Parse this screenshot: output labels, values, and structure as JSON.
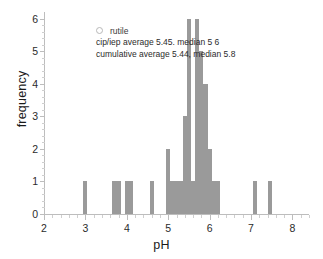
{
  "chart_data": {
    "type": "bar",
    "title": "",
    "xlabel": "pH",
    "ylabel": "frequency",
    "xlim": [
      2,
      8.4
    ],
    "ylim": [
      0,
      6.2
    ],
    "grid": false,
    "bar_color": "#9a9a9a",
    "legend": {
      "position": "upper-left-inside",
      "entries": [
        {
          "marker": "open-circle",
          "label": "rutile"
        }
      ]
    },
    "annotations": [
      "cip/iep average 5.45. median 5 6",
      "cumulative average 5.44, median 5.8"
    ],
    "xticks": [
      2,
      3,
      4,
      5,
      6,
      7,
      8
    ],
    "xtick_labels": [
      "2",
      "3",
      "4",
      "5",
      "6",
      "7",
      "8"
    ],
    "yticks": [
      0,
      1,
      2,
      3,
      4,
      5,
      6
    ],
    "ytick_labels": [
      "0",
      "1",
      "2",
      "3",
      "4",
      "5",
      "6"
    ],
    "bin_width": 0.1,
    "x": [
      3.0,
      3.7,
      3.8,
      4.0,
      4.1,
      4.6,
      5.0,
      5.1,
      5.2,
      5.3,
      5.4,
      5.5,
      5.6,
      5.7,
      5.8,
      5.9,
      6.0,
      6.1,
      6.2,
      7.1,
      7.45
    ],
    "values": [
      1,
      1,
      1,
      1,
      1,
      1,
      2,
      1,
      1,
      1,
      3,
      6,
      1,
      6,
      5,
      4,
      2,
      1,
      1,
      1,
      1
    ],
    "categories": [
      "3.0",
      "3.7",
      "3.8",
      "4.0",
      "4.1",
      "4.6",
      "5.0",
      "5.1",
      "5.2",
      "5.3",
      "5.4",
      "5.5",
      "5.6",
      "5.7",
      "5.8",
      "5.9",
      "6.0",
      "6.1",
      "6.2",
      "7.1",
      "7.45"
    ]
  }
}
